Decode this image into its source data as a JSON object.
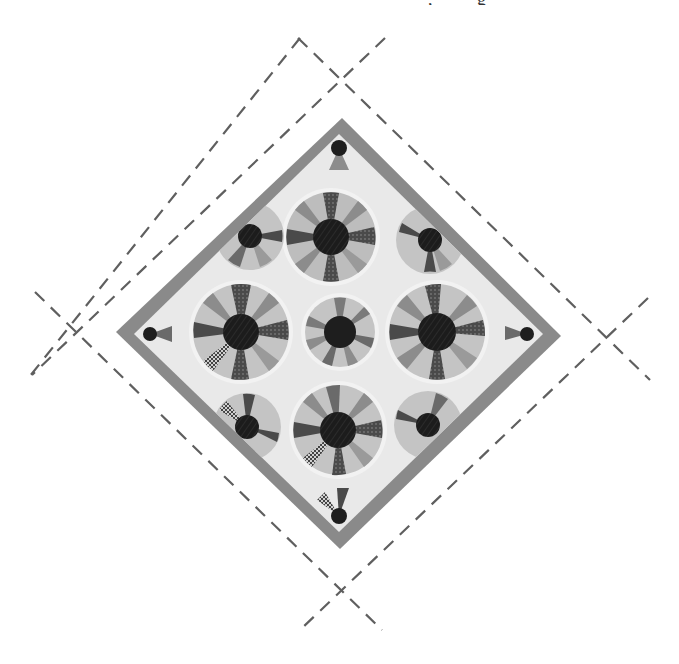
{
  "caption_fragment": ", g",
  "figure": {
    "colors": {
      "background": "#ffffff",
      "cut_lines": "#5f5f5f",
      "border": "#8a8a8a",
      "quilt_field": "#e8e8e8",
      "hub": "#1e1e1e",
      "spoke_dark": "#4a4a4a",
      "spoke_mid": "#8c8c8c",
      "spoke_light": "#bdbdbd"
    },
    "diamond": {
      "center_x": 339,
      "center_y": 334,
      "side": 308,
      "border_width": 18
    },
    "cut_line_crossings": [
      {
        "name": "top",
        "x": 342,
        "y": 78
      },
      {
        "name": "left",
        "x": 75,
        "y": 332
      },
      {
        "name": "right",
        "x": 606,
        "y": 338
      },
      {
        "name": "bottom",
        "x": 342,
        "y": 589
      }
    ],
    "wheels": [
      {
        "name": "top",
        "x": 331,
        "y": 237,
        "r": 45,
        "hub": 18
      },
      {
        "name": "left",
        "x": 241,
        "y": 332,
        "r": 48,
        "hub": 18
      },
      {
        "name": "center",
        "x": 340,
        "y": 332,
        "r": 35,
        "hub": 16
      },
      {
        "name": "right",
        "x": 437,
        "y": 332,
        "r": 48,
        "hub": 18
      },
      {
        "name": "bottom",
        "x": 338,
        "y": 430,
        "r": 45,
        "hub": 18
      },
      {
        "name": "upper-left-half",
        "x": 250,
        "y": 236,
        "r": 32,
        "hub": 12
      },
      {
        "name": "upper-right-half",
        "x": 430,
        "y": 240,
        "r": 32,
        "hub": 12
      },
      {
        "name": "lower-left-half",
        "x": 247,
        "y": 427,
        "r": 32,
        "hub": 12
      },
      {
        "name": "lower-right-half",
        "x": 428,
        "y": 425,
        "r": 32,
        "hub": 12
      }
    ]
  }
}
